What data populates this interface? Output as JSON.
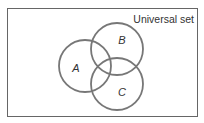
{
  "diagram": {
    "type": "venn",
    "universe_label": "Universal set",
    "sets": [
      {
        "id": "A",
        "label": "A",
        "cx": 85,
        "cy": 66,
        "r": 26
      },
      {
        "id": "B",
        "label": "B",
        "cx": 117,
        "cy": 49,
        "r": 26
      },
      {
        "id": "C",
        "label": "C",
        "cx": 117,
        "cy": 84,
        "r": 26
      }
    ],
    "colors": {
      "stroke": "#777777",
      "frame": "#666666",
      "text": "#333333"
    }
  }
}
